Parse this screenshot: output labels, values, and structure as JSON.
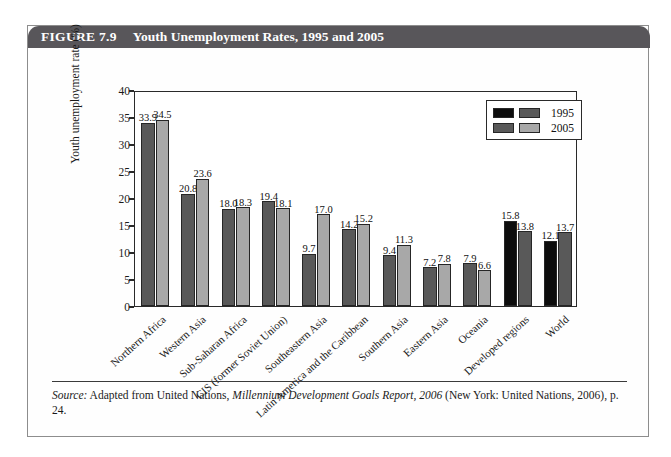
{
  "figure": {
    "number_label": "FIGURE 7.9",
    "title": "Youth Unemployment Rates, 1995 and 2005"
  },
  "source": {
    "label": "Source:",
    "text_before_italic": " Adapted from United Nations, ",
    "italic_text": "Millennium Development Goals Report, 2006",
    "text_after_italic": " (New York: United Nations, 2006), p. 24."
  },
  "colors": {
    "header_bar": "#58565a",
    "bar_black": "#0d0d0d",
    "bar_dark_gray": "#595959",
    "bar_light_gray": "#a8a8a8",
    "axis": "#2a2a2a",
    "text": "#1a1a1a",
    "figure_border": "#8d8d8d"
  },
  "chart_data": {
    "type": "bar",
    "title": "Youth Unemployment Rates, 1995 and 2005",
    "xlabel": "",
    "ylabel": "Youth unemployment rate (%)",
    "ylim": [
      0,
      40
    ],
    "yticks": [
      0,
      5,
      10,
      15,
      20,
      25,
      30,
      35,
      40
    ],
    "ytick_labels": [
      "0",
      "5",
      "10",
      "15",
      "20",
      "25",
      "30",
      "35",
      "40"
    ],
    "grid": false,
    "legend_position": "top-right",
    "categories": [
      "Northern Africa",
      "Western Asia",
      "Sub-Saharan Africa",
      "CIS (former Soviet Union)",
      "Southeastern Asia",
      "Latin America and the Caribbean",
      "Southern Asia",
      "Eastern Asia",
      "Oceania",
      "Developed regions",
      "World"
    ],
    "series": [
      {
        "name": "1995",
        "values": [
          33.9,
          20.8,
          18.0,
          19.4,
          9.7,
          14.2,
          9.4,
          7.2,
          7.9,
          15.8,
          12.1
        ],
        "value_labels": [
          "33.9",
          "20.8",
          "18.0",
          "19.4",
          "9.7",
          "14.2",
          "9.4",
          "7.2",
          "7.9",
          "15.8",
          "12.1"
        ],
        "colors": [
          "#595959",
          "#595959",
          "#595959",
          "#595959",
          "#595959",
          "#595959",
          "#595959",
          "#595959",
          "#595959",
          "#0d0d0d",
          "#0d0d0d"
        ]
      },
      {
        "name": "2005",
        "values": [
          34.5,
          23.6,
          18.3,
          18.1,
          17.0,
          15.2,
          11.3,
          7.8,
          6.6,
          13.8,
          13.7
        ],
        "value_labels": [
          "34.5",
          "23.6",
          "18.3",
          "18.1",
          "17.0",
          "15.2",
          "11.3",
          "7.8",
          "6.6",
          "13.8",
          "13.7"
        ],
        "colors": [
          "#a8a8a8",
          "#a8a8a8",
          "#a8a8a8",
          "#a8a8a8",
          "#a8a8a8",
          "#a8a8a8",
          "#a8a8a8",
          "#a8a8a8",
          "#a8a8a8",
          "#595959",
          "#595959"
        ]
      }
    ],
    "legend": [
      {
        "label": "1995",
        "swatches": [
          "#0d0d0d",
          "#595959"
        ]
      },
      {
        "label": "2005",
        "swatches": [
          "#595959",
          "#a8a8a8"
        ]
      }
    ]
  }
}
